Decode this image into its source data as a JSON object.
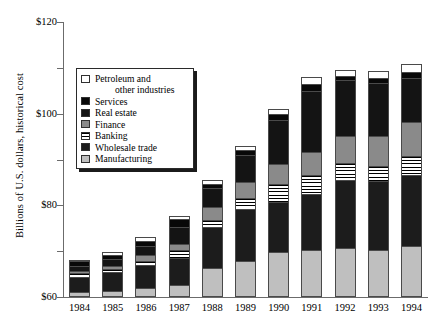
{
  "chart_data": {
    "type": "bar",
    "title": "",
    "subtitle": "",
    "xlabel": "",
    "ylabel": "Billions of U.S. dollars, historical cost",
    "stacked": true,
    "grid": false,
    "legend_position": "inside-upper-left",
    "ylim": [
      0,
      120
    ],
    "ytick_values": [
      0,
      20,
      40,
      60,
      80,
      100,
      120
    ],
    "ytick_labels": [
      "$0",
      "$20",
      "$40",
      "$60",
      "$80",
      "$100",
      "$120"
    ],
    "categories": [
      "1984",
      "1985",
      "1986",
      "1987",
      "1988",
      "1989",
      "1990",
      "1991",
      "1992",
      "1993",
      "1994"
    ],
    "series": [
      {
        "name": "Manufacturing",
        "swatch": "#bfbfbf",
        "values": [
          1.5,
          2.0,
          3.0,
          4.5,
          12.0,
          15.0,
          19.0,
          20.0,
          20.5,
          20.0,
          21.5
        ]
      },
      {
        "name": "Wholesale trade",
        "swatch": "#1c1c1c",
        "values": [
          7.0,
          8.5,
          10.5,
          12.0,
          18.0,
          23.0,
          22.0,
          24.5,
          30.0,
          30.0,
          31.5
        ]
      },
      {
        "name": "Banking",
        "swatch": "striped-horizontal",
        "values": [
          1.5,
          1.5,
          2.0,
          3.5,
          3.5,
          5.0,
          8.0,
          8.5,
          7.5,
          7.0,
          8.0
        ]
      },
      {
        "name": "Finance",
        "swatch": "#8a8a8a",
        "values": [
          1.0,
          1.5,
          2.5,
          3.0,
          5.5,
          7.0,
          9.0,
          10.0,
          12.0,
          13.0,
          15.0
        ]
      },
      {
        "name": "Real estate",
        "swatch": "#141414",
        "values": [
          2.5,
          3.0,
          4.0,
          7.5,
          8.5,
          12.0,
          19.0,
          27.0,
          24.5,
          23.5,
          19.5
        ]
      },
      {
        "name": "Services",
        "swatch": "#080808",
        "values": [
          2.0,
          2.0,
          2.5,
          3.5,
          2.0,
          2.0,
          3.0,
          3.0,
          2.0,
          2.0,
          2.5
        ]
      },
      {
        "name": "Petroleum and other industries",
        "swatch": "#ffffff",
        "values": [
          0.5,
          1.0,
          1.5,
          1.5,
          1.5,
          2.0,
          2.0,
          3.0,
          2.5,
          3.0,
          3.5
        ]
      }
    ],
    "totals": [
      16.0,
      19.5,
      26.0,
      35.5,
      51.0,
      66.0,
      82.0,
      96.0,
      99.0,
      98.5,
      101.5
    ]
  },
  "legend": {
    "entries": [
      {
        "label": "Petroleum and",
        "label_cont": "other industries",
        "swatch_class": "f-petroleum",
        "name": "petroleum-and-other-industries"
      },
      {
        "label": "Services",
        "label_cont": "",
        "swatch_class": "f-services",
        "name": "services"
      },
      {
        "label": "Real estate",
        "label_cont": "",
        "swatch_class": "f-realestate",
        "name": "real-estate"
      },
      {
        "label": "Finance",
        "label_cont": "",
        "swatch_class": "f-finance",
        "name": "finance"
      },
      {
        "label": "Banking",
        "label_cont": "",
        "swatch_class": "f-banking",
        "name": "banking"
      },
      {
        "label": "Wholesale trade",
        "label_cont": "",
        "swatch_class": "f-wholesale",
        "name": "wholesale-trade"
      },
      {
        "label": "Manufacturing",
        "label_cont": "",
        "swatch_class": "f-manufacturing",
        "name": "manufacturing"
      }
    ]
  }
}
